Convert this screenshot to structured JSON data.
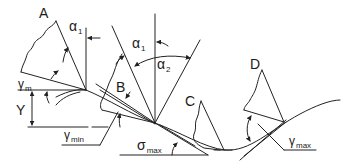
{
  "figure": {
    "type": "diagram",
    "colors": {
      "stroke": "#222222",
      "background": "#ffffff"
    }
  },
  "labels": {
    "A": "A",
    "B": "B",
    "C": "C",
    "D": "D",
    "alpha1_left": {
      "symbol": "α",
      "sub": "1"
    },
    "alpha1_center": {
      "symbol": "α",
      "sub": "1"
    },
    "alpha2": {
      "symbol": "α",
      "sub": "2"
    },
    "gamma_m": {
      "symbol": "γ",
      "sub": "m"
    },
    "gamma_min": {
      "symbol": "γ",
      "sub": "min"
    },
    "gamma_max": {
      "symbol": "γ",
      "sub": "max"
    },
    "sigma_max": {
      "symbol": "σ",
      "sub": "max"
    },
    "Y": "Y"
  }
}
